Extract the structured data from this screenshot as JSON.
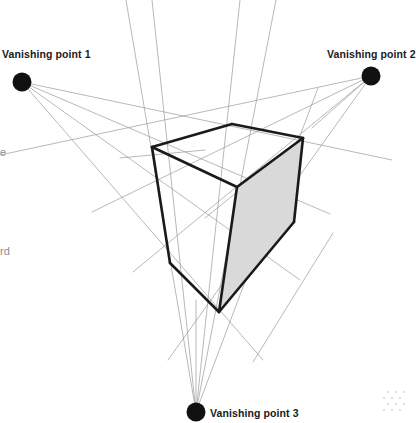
{
  "figure": {
    "type": "three-point-perspective-construction",
    "background_color": "#ffffff",
    "construction_line_color": "#9a9a9e",
    "solid_edge_color": "#1a1a1a",
    "shaded_face_color": "#d9d9d9",
    "vanishing_point_color": "#111111",
    "canvas": {
      "width": 411,
      "height": 423
    }
  },
  "labels": {
    "vp1": "Vanishing point 1",
    "vp2": "Vanishing point 2",
    "vp3": "Vanishing point 3",
    "clipped_left_1": "e",
    "clipped_left_2": "rd"
  },
  "vanishing_points": [
    {
      "id": "vp1",
      "label": "Vanishing point 1",
      "x": 22,
      "y": 82,
      "radius": 9.5
    },
    {
      "id": "vp2",
      "label": "Vanishing point 2",
      "x": 371,
      "y": 76,
      "radius": 9.5
    },
    {
      "id": "vp3",
      "label": "Vanishing point 3",
      "x": 196,
      "y": 412,
      "radius": 9.5
    }
  ],
  "box_vertices": {
    "top_apex": {
      "x": 232,
      "y": 124
    },
    "top_left": {
      "x": 152,
      "y": 147
    },
    "top_right": {
      "x": 303,
      "y": 138
    },
    "center": {
      "x": 237,
      "y": 187
    },
    "bottom_left": {
      "x": 170,
      "y": 263
    },
    "bottom_apex": {
      "x": 219,
      "y": 312
    },
    "right_edge": {
      "x": 294,
      "y": 222
    }
  },
  "box_edges": [
    {
      "name": "top-left-ridge",
      "from": "top_left",
      "to": "top_apex"
    },
    {
      "name": "top-right-ridge",
      "from": "top_apex",
      "to": "top_right"
    },
    {
      "name": "top-inner-left",
      "from": "top_left",
      "to": "center"
    },
    {
      "name": "top-inner-right",
      "from": "center",
      "to": "top_right"
    },
    {
      "name": "left-vertical",
      "from": "top_left",
      "to": "bottom_left"
    },
    {
      "name": "center-vertical",
      "from": "center",
      "to": "bottom_apex"
    },
    {
      "name": "right-vertical",
      "from": "top_right",
      "to": "right_edge"
    },
    {
      "name": "bottom-left-edge",
      "from": "bottom_left",
      "to": "bottom_apex"
    },
    {
      "name": "bottom-right-edge",
      "from": "bottom_apex",
      "to": "right_edge"
    }
  ],
  "shaded_face": {
    "name": "right-face",
    "fill": "#d9d9d9",
    "points": "237,187 303,138 294,222 219,312"
  },
  "construction_lines_count": 18,
  "notes": {
    "shading": "Only the right-hand face of the box is filled light grey; the top and left faces are white.",
    "stroke_weights": {
      "box_edge_px": 2.6,
      "construction_px": 0.7
    }
  }
}
